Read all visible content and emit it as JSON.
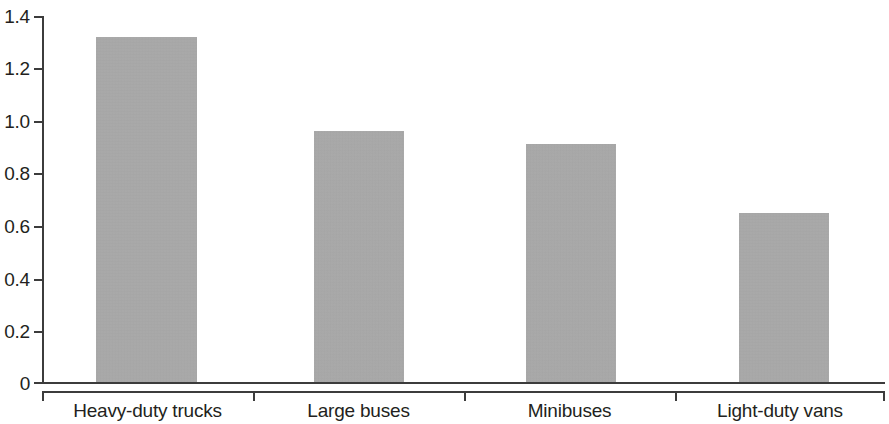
{
  "chart_data": {
    "type": "bar",
    "title": "",
    "subtitle": "",
    "xlabel": "",
    "ylabel": "",
    "categories": [
      "Heavy-duty trucks",
      "Large buses",
      "Minibuses",
      "Light-duty vans"
    ],
    "values": [
      1.32,
      0.96,
      0.91,
      0.65
    ],
    "ylim": [
      0,
      1.4
    ],
    "ytick_labels": [
      "0",
      "0.2",
      "0.4",
      "0.6",
      "0.8",
      "1.0",
      "1.2",
      "1.4"
    ],
    "ytick_values": [
      0,
      0.2,
      0.4,
      0.6,
      0.8,
      1.0,
      1.2,
      1.4
    ],
    "grid": false,
    "legend": null,
    "legend_position": "none",
    "annotations": [],
    "bar_color": "#a9a9a9",
    "axis_color": "#3c3c3c",
    "text_color": "#231f20"
  },
  "axis": {
    "y_ticks": [
      {
        "label": "1.4",
        "value": 1.4
      },
      {
        "label": "1.2",
        "value": 1.2
      },
      {
        "label": "1.0",
        "value": 1.0
      },
      {
        "label": "0.8",
        "value": 0.8
      },
      {
        "label": "0.6",
        "value": 0.6
      },
      {
        "label": "0.4",
        "value": 0.4
      },
      {
        "label": "0.2",
        "value": 0.2
      },
      {
        "label": "0",
        "value": 0
      }
    ]
  },
  "bars": [
    {
      "label": "Heavy-duty trucks",
      "value": 1.32
    },
    {
      "label": "Large buses",
      "value": 0.96
    },
    {
      "label": "Minibuses",
      "value": 0.91
    },
    {
      "label": "Light-duty vans",
      "value": 0.65
    }
  ]
}
